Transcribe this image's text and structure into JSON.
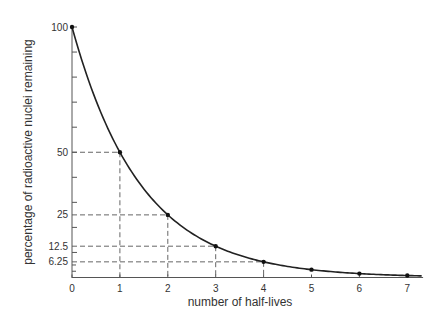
{
  "chart_data": {
    "type": "line",
    "title": "",
    "xlabel": "number of half-lives",
    "ylabel": "percentage of radioactive nuclei remaining",
    "x": [
      0,
      1,
      2,
      3,
      4,
      5,
      6,
      7
    ],
    "series": [
      {
        "name": "radioactive decay",
        "values": [
          100,
          50,
          25,
          12.5,
          6.25,
          3.125,
          1.5625,
          0.78125
        ]
      }
    ],
    "xticks": [
      "0",
      "1",
      "2",
      "3",
      "4",
      "5",
      "6",
      "7"
    ],
    "yticks_labeled": [
      "100",
      "50",
      "25",
      "12.5",
      "6.25"
    ],
    "xlim": [
      0,
      7.3
    ],
    "ylim": [
      0,
      100
    ],
    "grid": false,
    "guide_lines": [
      {
        "x": 1,
        "y": 50
      },
      {
        "x": 2,
        "y": 25
      },
      {
        "x": 3,
        "y": 12.5
      },
      {
        "x": 4,
        "y": 6.25
      }
    ],
    "line_color": "#222222",
    "guide_color": "#666666"
  }
}
